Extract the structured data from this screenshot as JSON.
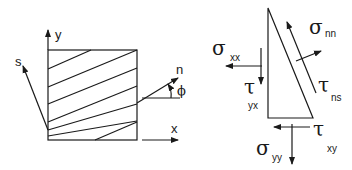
{
  "left_figure": {
    "axis_labels": {
      "y": "y",
      "x": "x",
      "s": "s",
      "n": "n",
      "angle": "ϕ"
    },
    "element": "hatched square element with inclined plane lines"
  },
  "right_figure": {
    "element": "triangular wedge",
    "stresses": {
      "sigma_xx": {
        "symbol": "σ",
        "subscript": "xx"
      },
      "tau_yx": {
        "symbol": "τ",
        "subscript": "yx"
      },
      "sigma_nn": {
        "symbol": "σ",
        "subscript": "nn"
      },
      "tau_ns": {
        "symbol": "τ",
        "subscript": "ns"
      },
      "tau_xy": {
        "symbol": "τ",
        "subscript": "xy"
      },
      "sigma_yy": {
        "symbol": "σ",
        "subscript": "yy"
      }
    }
  },
  "colors": {
    "stroke": "#1a1a1a",
    "background": "#ffffff"
  }
}
